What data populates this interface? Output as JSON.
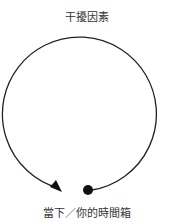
{
  "diagram": {
    "top_label": "干擾因素",
    "bottom_label": "當下／你的時間箱",
    "stroke_color": "#222222"
  }
}
